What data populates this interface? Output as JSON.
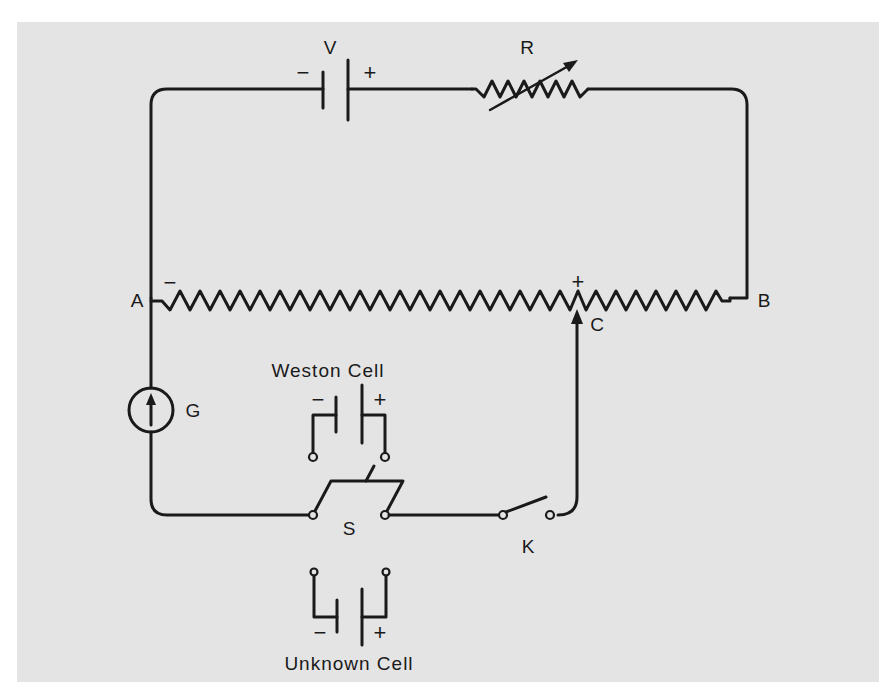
{
  "diagram": {
    "type": "circuit-schematic",
    "background_color": "#e4e4e4",
    "line_color": "#1a1a1a"
  },
  "components": {
    "battery": {
      "label": "V",
      "neg_sign": "−",
      "pos_sign": "+"
    },
    "rheostat": {
      "label": "R"
    },
    "slide_wire": {
      "end_a_label": "A",
      "end_b_label": "B",
      "contact_label": "C",
      "neg_sign": "−",
      "pos_sign": "+"
    },
    "galvanometer": {
      "label": "G"
    },
    "weston_cell": {
      "label": "Weston Cell",
      "neg_sign": "−",
      "pos_sign": "+"
    },
    "selector_switch": {
      "label": "S"
    },
    "key_switch": {
      "label": "K"
    },
    "unknown_cell": {
      "label": "Unknown Cell",
      "neg_sign": "−",
      "pos_sign": "+"
    }
  }
}
